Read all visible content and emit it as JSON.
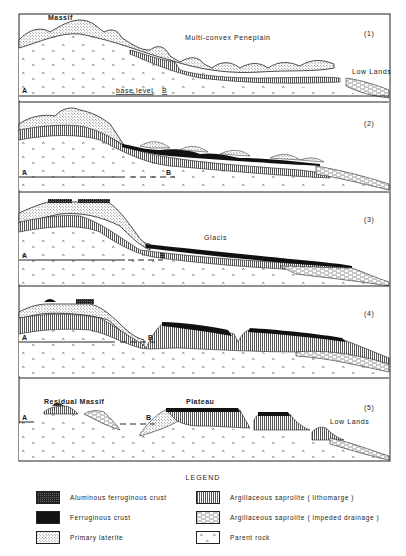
{
  "figure": {
    "frame": {
      "x": 19,
      "y": 14,
      "w": 371,
      "h": 447
    },
    "colors": {
      "ink": "#1a1a1a",
      "paper": "#ffffff",
      "crust": "#111111",
      "alum_crust": "#333333",
      "lithomarge": "#555555",
      "laterite": "#888888"
    },
    "panels": [
      {
        "number": "(1)",
        "top": 14,
        "bottom": 102,
        "labels": {
          "massif": "Massif",
          "title": "Multi-convex Peneplain",
          "lowlands": "Low Lands",
          "a": "A",
          "base_level": "base level",
          "b": "B"
        }
      },
      {
        "number": "(2)",
        "top": 102,
        "bottom": 192,
        "labels": {
          "a": "A",
          "b": "B"
        }
      },
      {
        "number": "(3)",
        "top": 192,
        "bottom": 286,
        "labels": {
          "a": "A",
          "b": "B",
          "title": "Glacis"
        }
      },
      {
        "number": "(4)",
        "top": 286,
        "bottom": 378,
        "labels": {
          "a": "A",
          "b": "B"
        }
      },
      {
        "number": "(5)",
        "top": 378,
        "bottom": 461,
        "labels": {
          "a": "A",
          "b": "B",
          "residual_massif": "Residual Massif",
          "plateau": "Plateau",
          "lowlands": "Low Lands"
        }
      }
    ]
  },
  "legend": {
    "title": "LEGEND",
    "items": [
      {
        "key": "aluminous-ferruginous-crust",
        "label": "Aluminous ferruginous crust",
        "pattern": "alum"
      },
      {
        "key": "ferruginous-crust",
        "label": "Ferruginous crust",
        "pattern": "crust"
      },
      {
        "key": "primary-laterite",
        "label": "Primary laterite",
        "pattern": "dots"
      },
      {
        "key": "argillaceous-saprolite-lithomarge",
        "label": "Argillaceous saprolite ( lithomarge )",
        "pattern": "vlines"
      },
      {
        "key": "argillaceous-saprolite-impeded-drainage",
        "label": "Argillaceous saprolite ( impeded drainage )",
        "pattern": "dash"
      },
      {
        "key": "parent-rock",
        "label": "Parent rock",
        "pattern": "rock"
      }
    ]
  }
}
